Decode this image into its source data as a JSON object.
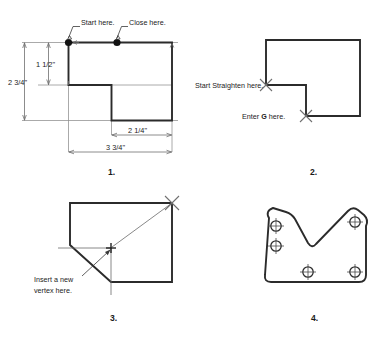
{
  "document": {
    "kind": "cad-tutorial-figure",
    "panel_count": 4
  },
  "panels": [
    {
      "number": "1.",
      "name": "polyline-start-close",
      "annotations": [
        {
          "id": "start-here",
          "text": "Start here."
        },
        {
          "id": "close-here",
          "text": "Close here."
        }
      ],
      "dimensions": [
        {
          "id": "height-upper",
          "text": "1 1/2\"",
          "orientation": "vertical"
        },
        {
          "id": "height-total",
          "text": "2 3/4\"",
          "orientation": "vertical"
        },
        {
          "id": "width-notch",
          "text": "2 1/4\"",
          "orientation": "horizontal"
        },
        {
          "id": "width-total",
          "text": "3 3/4\"",
          "orientation": "horizontal"
        }
      ]
    },
    {
      "number": "2.",
      "name": "straighten-segment",
      "annotations": [
        {
          "id": "start-straighten-here",
          "text": "Start Straighten here."
        },
        {
          "id": "enter-g-here",
          "text_before": "Enter ",
          "text_key": "G",
          "text_after": " here."
        }
      ],
      "dimensions": []
    },
    {
      "number": "3.",
      "name": "insert-vertex",
      "annotations": [
        {
          "id": "insert-vertex-here-line1",
          "text": "Insert a new"
        },
        {
          "id": "insert-vertex-here-line2",
          "text": "vertex here."
        }
      ],
      "dimensions": []
    },
    {
      "number": "4.",
      "name": "finished-bracket",
      "annotations": [],
      "dimensions": [],
      "hole_count": 5
    }
  ],
  "colors": {
    "background": "#ffffff",
    "object_line": "#2b2b2b",
    "extension_line": "#8d8d8d",
    "dimension_line": "#6f6f6f",
    "marker": "#707070",
    "node_dot": "#121212",
    "text": "#1a1a1a"
  }
}
